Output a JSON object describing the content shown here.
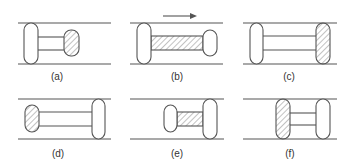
{
  "figure": {
    "direction_arrow": "right",
    "colors": {
      "stroke": "#555555",
      "hatch": "#777777",
      "background": "#ffffff"
    },
    "panels": [
      {
        "id": "a",
        "label": "(a)",
        "active": "front-small-clamp"
      },
      {
        "id": "b",
        "label": "(b)",
        "active": "body-extending"
      },
      {
        "id": "c",
        "label": "(c)",
        "active": "front-clamp-engaged"
      },
      {
        "id": "d",
        "label": "(d)",
        "active": "rear-small-clamp"
      },
      {
        "id": "e",
        "label": "(e)",
        "active": "body-contracting"
      },
      {
        "id": "f",
        "label": "(f)",
        "active": "rear-clamp-engaged"
      }
    ]
  }
}
